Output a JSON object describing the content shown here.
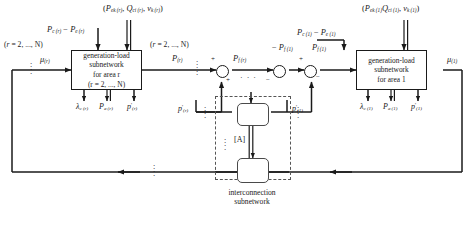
{
  "diagram": {
    "caption": "interconnection\nsubnetwork",
    "caption_line1": "interconnection",
    "caption_line2": "subnetwork"
  },
  "blocks": {
    "area_r": {
      "line1": "generation-load",
      "line2": "subnetwork",
      "line3": "for area r",
      "line4": "(r = 2, ..., N)"
    },
    "area_1": {
      "line1": "generation-load",
      "line2": "subnetwork",
      "line3": "for area 1"
    },
    "interconnection_matrix_label": "[A]"
  },
  "labels": {
    "range_left": "(r = 2, ..., N)",
    "range_mid": "(r = 2, ..., N)",
    "input_top_r": "P",
    "input_top_r_full": "Pc (r) − Pe (r)",
    "input_top_1_full": "Pc (1) − Pe (1)",
    "triple_r": "(Pek (r), Qci (r), vk (r))",
    "triple_1": "(Pek (1), Qci (1), vk (1))",
    "mu_r": "μ(r)",
    "mu_1": "μ(1)",
    "P_r": "P(r)",
    "P_f_r": "Pf (r)",
    "minus_P_f_1": "− Pf (1)",
    "P_f_1": "Pf (1)",
    "lambda_r": "λc (r)",
    "Pa_r": "Pa (r)",
    "Pprime_r": "P'(r)",
    "lambda_1": "λc (1)",
    "Pa_1": "Pa (1)",
    "Pprime_1": "P'(1)",
    "p_prime_r": "p'(r)",
    "p_prime_1": "p'(1)"
  },
  "signs": {
    "plus_a": "+",
    "plus_b": "+",
    "plus_c": "+",
    "minus_a": "−",
    "minus_b": "−"
  },
  "colors": {
    "ink": "#1a1a1a",
    "dashed": "#555555",
    "paper": "#ffffff"
  }
}
